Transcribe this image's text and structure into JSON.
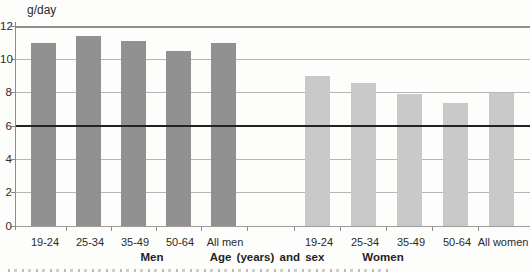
{
  "chart_data": {
    "type": "bar",
    "title": "",
    "ylabel": "g/day",
    "xlabel": "Age (years) and sex",
    "ylim": [
      0,
      12
    ],
    "yticks": [
      12,
      10,
      8,
      6,
      4,
      2,
      0
    ],
    "grid": true,
    "legend": "none",
    "reference_line": {
      "value": 6,
      "color": "#222222"
    },
    "groups": [
      {
        "name": "Men",
        "color": "#919191",
        "categories": [
          "19-24",
          "25-34",
          "35-49",
          "50-64",
          "All men"
        ],
        "values": [
          11.0,
          11.4,
          11.1,
          10.5,
          11.0
        ]
      },
      {
        "name": "Women",
        "color": "#c9c9c9",
        "categories": [
          "19-24",
          "25-34",
          "35-49",
          "50-64",
          "All women"
        ],
        "values": [
          9.0,
          8.6,
          7.9,
          7.4,
          8.0
        ]
      }
    ]
  }
}
